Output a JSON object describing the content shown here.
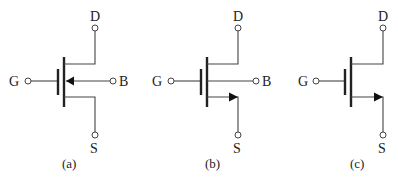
{
  "figure": {
    "panels": [
      {
        "id": "a",
        "caption": "(a)",
        "terminals": {
          "gate": "G",
          "drain": "D",
          "source": "S",
          "body": "B"
        },
        "body_arrow": "pointing-in-toward-channel",
        "description": "MOSFET symbol with separate body terminal"
      },
      {
        "id": "b",
        "caption": "(b)",
        "terminals": {
          "gate": "G",
          "drain": "D",
          "source": "S",
          "body": "B"
        },
        "source_arrow": "pointing-out-on-source",
        "description": "MOSFET symbol with arrow on source and body terminal"
      },
      {
        "id": "c",
        "caption": "(c)",
        "terminals": {
          "gate": "G",
          "drain": "D",
          "source": "S"
        },
        "source_arrow": "pointing-out-on-source",
        "description": "Simplified 3-terminal MOSFET symbol"
      }
    ],
    "colors": {
      "line": "#444444",
      "plate": "#222222",
      "background": "#ffffff"
    }
  }
}
